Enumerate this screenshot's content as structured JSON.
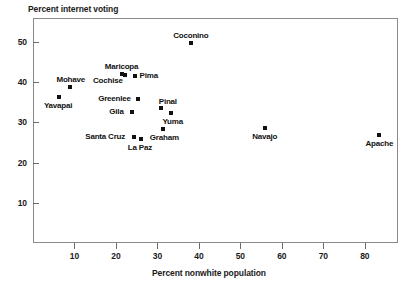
{
  "chart_data": {
    "type": "scatter",
    "title": "",
    "xlabel": "Percent nonwhite population",
    "ylabel": "Percent internet voting",
    "xlim": [
      0,
      88
    ],
    "ylim": [
      0,
      56
    ],
    "xticks": [
      10,
      20,
      30,
      40,
      50,
      60,
      70,
      80
    ],
    "yticks": [
      10,
      20,
      30,
      40,
      50
    ],
    "grid": false,
    "legend": "none",
    "marker_color": "#111111",
    "axis_color": "#8a8a8a",
    "points": [
      {
        "label": "Yavapai",
        "x": 6.3,
        "y": 36.3,
        "label_pos": "below"
      },
      {
        "label": "Mohave",
        "x": 8.8,
        "y": 38.8,
        "label_pos": "above"
      },
      {
        "label": "Maricopa",
        "x": 21.5,
        "y": 42.1,
        "label_pos": "above"
      },
      {
        "label": "Cochise",
        "x": 22.3,
        "y": 41.8,
        "label_pos": "left-below"
      },
      {
        "label": "Pima",
        "x": 24.5,
        "y": 41.6,
        "label_pos": "right"
      },
      {
        "label": "Gila",
        "x": 23.8,
        "y": 32.6,
        "label_pos": "left"
      },
      {
        "label": "Greenlee",
        "x": 25.3,
        "y": 35.8,
        "label_pos": "left"
      },
      {
        "label": "Santa Cruz",
        "x": 24.3,
        "y": 26.3,
        "label_pos": "left"
      },
      {
        "label": "La Paz",
        "x": 26.0,
        "y": 26.0,
        "label_pos": "below"
      },
      {
        "label": "Pinal",
        "x": 30.8,
        "y": 33.5,
        "label_pos": "above-right"
      },
      {
        "label": "Graham",
        "x": 31.3,
        "y": 28.4,
        "label_pos": "below"
      },
      {
        "label": "Yuma",
        "x": 33.3,
        "y": 32.3,
        "label_pos": "below"
      },
      {
        "label": "Coconino",
        "x": 38.0,
        "y": 49.7,
        "label_pos": "above"
      },
      {
        "label": "Navajo",
        "x": 56.0,
        "y": 28.7,
        "label_pos": "below"
      },
      {
        "label": "Apache",
        "x": 83.3,
        "y": 26.8,
        "label_pos": "below"
      }
    ]
  }
}
